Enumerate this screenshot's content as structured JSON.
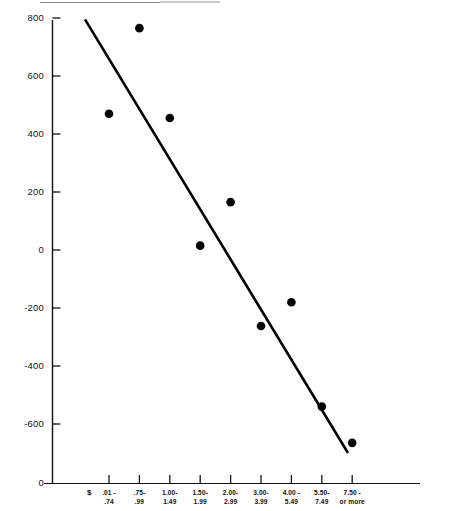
{
  "figure": {
    "currency_symbol": "$"
  },
  "chart_data": {
    "type": "scatter",
    "title": "",
    "xlabel": "",
    "ylabel": "",
    "grid": false,
    "legend": null,
    "ylim": [
      -700,
      800
    ],
    "yticks": [
      800,
      600,
      400,
      200,
      0,
      -200,
      -400,
      -600
    ],
    "ytick_labels": [
      "800",
      "600",
      "400",
      "200",
      "0",
      "-200",
      "-400",
      "-600"
    ],
    "axis_break_label": "0",
    "categories": [
      {
        "line1": ".01 -",
        "line2": ".74"
      },
      {
        "line1": ".75-",
        "line2": ".99"
      },
      {
        "line1": "1.00-",
        "line2": "1.49"
      },
      {
        "line1": "1.50-",
        "line2": "1.99"
      },
      {
        "line1": "2.00-",
        "line2": "2.99"
      },
      {
        "line1": "3.00-",
        "line2": "3.99"
      },
      {
        "line1": "4.00 -",
        "line2": "5.49"
      },
      {
        "line1": "5.50-",
        "line2": "7.49"
      },
      {
        "line1": "7.50 -",
        "line2": "or more"
      }
    ],
    "values": [
      470,
      765,
      455,
      15,
      165,
      -262,
      -180,
      -540,
      -665
    ],
    "series": [
      {
        "name": "observations",
        "marker": "filled-circle",
        "color": "#000000",
        "values": [
          470,
          765,
          455,
          15,
          165,
          -262,
          -180,
          -540,
          -665
        ]
      }
    ],
    "trendline": {
      "type": "linear-fit",
      "color": "#000000",
      "x_start_px": 85,
      "x_end_px": 348,
      "y_start_value": 795,
      "y_end_value": -700
    }
  }
}
